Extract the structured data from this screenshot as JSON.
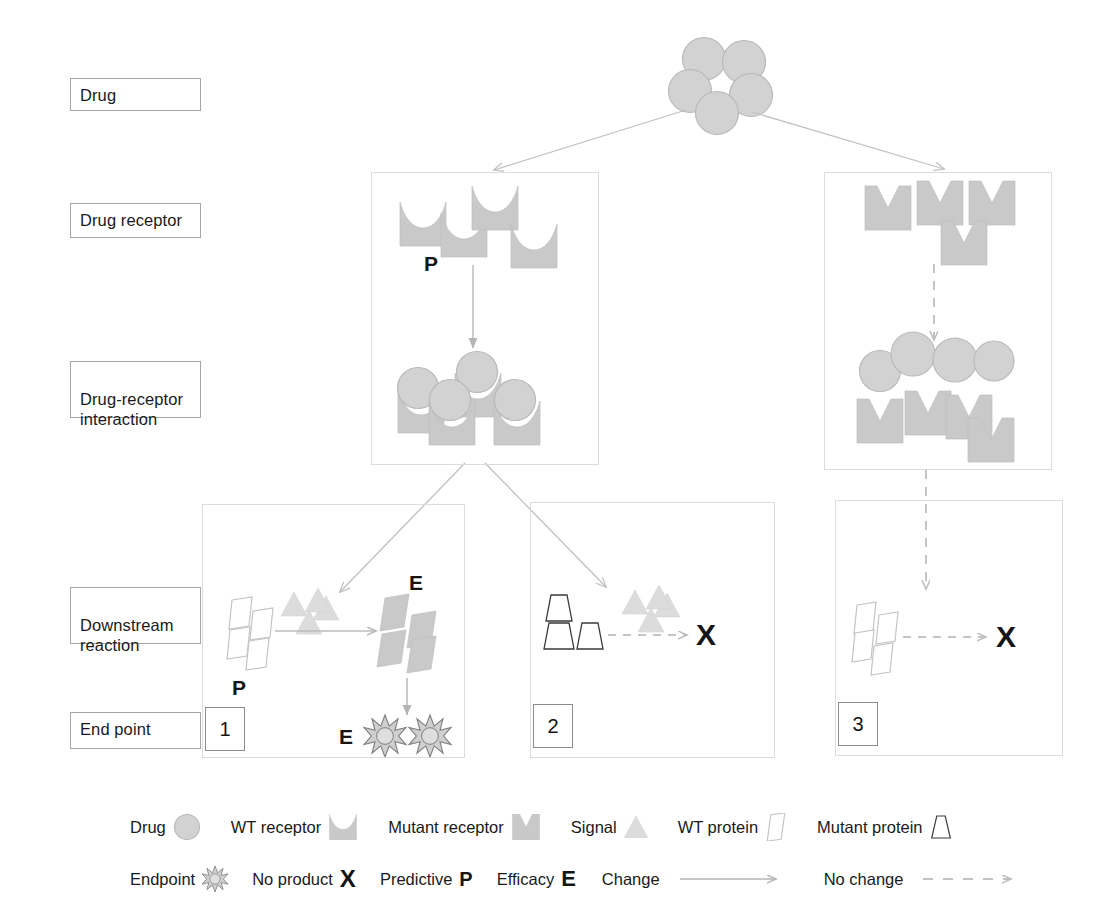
{
  "stages": [
    {
      "id": "drug",
      "label": "Drug"
    },
    {
      "id": "receptor",
      "label": "Drug receptor"
    },
    {
      "id": "interaction",
      "label": "Drug-receptor\ninteraction"
    },
    {
      "id": "downstream",
      "label": "Downstream\nreaction"
    },
    {
      "id": "endpoint",
      "label": "End point"
    }
  ],
  "panels": [
    {
      "index": "1",
      "marker_p": "P",
      "marker_e_product": "E",
      "marker_e_endpoint": "E"
    },
    {
      "index": "2",
      "marker_x": "X"
    },
    {
      "index": "3",
      "marker_x": "X"
    }
  ],
  "markers": {
    "receptor_wt_predictive": "P",
    "panel1_protein_predictive": "P",
    "panel1_product_efficacy": "E",
    "panel1_endpoint_efficacy": "E",
    "panel2_no_product": "X",
    "panel3_no_product": "X"
  },
  "legend": {
    "row1": [
      {
        "label": "Drug",
        "icon": "drug-circle-icon"
      },
      {
        "label": "WT receptor",
        "icon": "wt-receptor-icon"
      },
      {
        "label": "Mutant receptor",
        "icon": "mutant-receptor-icon"
      },
      {
        "label": "Signal",
        "icon": "signal-triangle-icon"
      },
      {
        "label": "WT protein",
        "icon": "wt-protein-icon"
      },
      {
        "label": "Mutant protein",
        "icon": "mutant-protein-icon"
      }
    ],
    "row2": [
      {
        "label": "Endpoint",
        "icon": "endpoint-starburst-icon",
        "symbol": ""
      },
      {
        "label": "No product",
        "icon": "letter-symbol",
        "symbol": "X"
      },
      {
        "label": "Predictive",
        "icon": "letter-symbol",
        "symbol": "P"
      },
      {
        "label": "Efficacy",
        "icon": "letter-symbol",
        "symbol": "E"
      },
      {
        "label": "Change",
        "icon": "solid-arrow-icon",
        "symbol": ""
      },
      {
        "label": "No change",
        "icon": "dashed-arrow-icon",
        "symbol": ""
      }
    ]
  },
  "colors": {
    "shape_fill": "#c9c9c9",
    "shape_stroke": "#b0b0b0",
    "signal_fill": "#dcdcdc",
    "arrow_solid": "#b5b5b5",
    "arrow_dashed": "#bdbdbd",
    "panel_border": "#dcdcdc",
    "label_border": "#a6a6a6",
    "text": "#1a1a1a"
  },
  "counts": {
    "drug_cluster_circles": 5,
    "wt_receptors": 4,
    "mutant_receptors_top": 4,
    "wt_complexes": 4,
    "mutant_free_drugs": 4,
    "mutant_free_receptors": 4,
    "panel1_wt_proteins": 4,
    "panel1_signals": 4,
    "panel1_products": 4,
    "panel1_endpoints": 2,
    "panel2_mutant_proteins": 3,
    "panel2_signals": 4,
    "panel3_wt_proteins": 4
  }
}
